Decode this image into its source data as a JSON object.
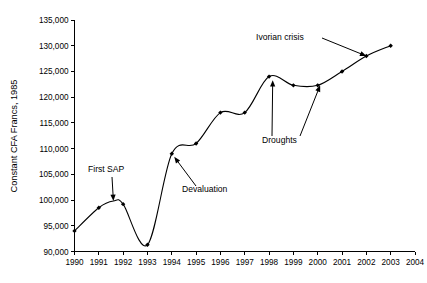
{
  "chart_data": {
    "type": "line",
    "title": "",
    "xlabel": "",
    "ylabel": "Constant CFA Francs, 1985",
    "xlim": [
      1990,
      2004
    ],
    "ylim": [
      90000,
      135000
    ],
    "grid": false,
    "legend": "none",
    "x": [
      1990,
      1991,
      1992,
      1993,
      1994,
      1995,
      1996,
      1997,
      1998,
      1999,
      2000,
      2001,
      2002,
      2003
    ],
    "values": [
      94000,
      98500,
      99200,
      91300,
      109000,
      111000,
      117000,
      117000,
      124000,
      122300,
      122300,
      125000,
      128000,
      130000
    ],
    "series": [
      {
        "name": "Constant CFA Francs, 1985",
        "values": [
          94000,
          98500,
          99200,
          91300,
          109000,
          111000,
          117000,
          117000,
          124000,
          122300,
          122300,
          125000,
          128000,
          130000
        ]
      }
    ],
    "x_tick_labels": [
      "1990",
      "1991",
      "1992",
      "1993",
      "1994",
      "1995",
      "1996",
      "1997",
      "1998",
      "1999",
      "2000",
      "2001",
      "2002",
      "2003",
      "2004"
    ],
    "y_tick_labels": [
      "90,000",
      "95,000",
      "100,000",
      "105,000",
      "110,000",
      "115,000",
      "120,000",
      "125,000",
      "130,000",
      "135,000"
    ],
    "y_tick_values": [
      90000,
      95000,
      100000,
      105000,
      110000,
      115000,
      120000,
      125000,
      130000,
      135000
    ],
    "annotations": [
      {
        "label": "First SAP",
        "target_x": 1991.6,
        "target_y": 99800
      },
      {
        "label": "Devaluation",
        "target_x": 1994.1,
        "target_y": 108400
      },
      {
        "label": "Droughts",
        "target_x": 1998.15,
        "target_y": 123300
      },
      {
        "label": "Droughts",
        "target_x": 2000.1,
        "target_y": 122300
      },
      {
        "label": "Ivorian crisis",
        "target_x": 2002.0,
        "target_y": 128000
      }
    ],
    "colors": {
      "line": "#000000",
      "marker": "#000000",
      "axis": "#000000",
      "background": "#ffffff"
    }
  }
}
